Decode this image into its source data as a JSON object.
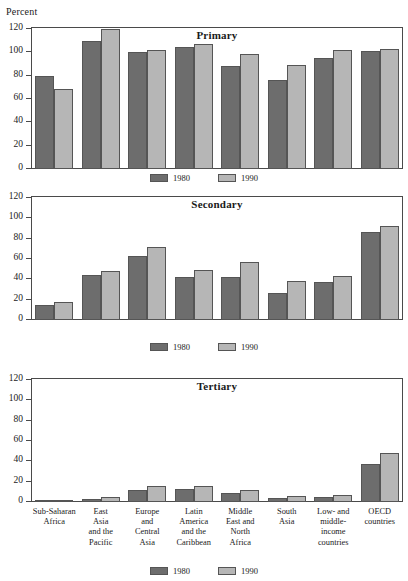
{
  "axis_label": "Percent",
  "legend": {
    "items": [
      {
        "label": "1980",
        "color": "#6d6d6d",
        "key": "s1980"
      },
      {
        "label": "1990",
        "color": "#b6b6b6",
        "key": "s1990"
      }
    ]
  },
  "y_ticks": [
    "0",
    "20",
    "40",
    "60",
    "80",
    "100",
    "120"
  ],
  "categories": [
    "Sub-Saharan Africa",
    "East Asia and the Pacific",
    "Europe and Central Asia",
    "Latin America and the Caribbean",
    "Middle East and North Africa",
    "South Asia",
    "Low- and middle-income countries",
    "OECD countries"
  ],
  "category_lines": [
    [
      "Sub-Saharan",
      "Africa"
    ],
    [
      "East",
      "Asia",
      "and the",
      "Pacific"
    ],
    [
      "Europe",
      "and",
      "Central",
      "Asia"
    ],
    [
      "Latin",
      "America",
      "and the",
      "Caribbean"
    ],
    [
      "Middle",
      "East and",
      "North",
      "Africa"
    ],
    [
      "South",
      "Asia"
    ],
    [
      "Low- and",
      "middle-",
      "income",
      "countries"
    ],
    [
      "OECD",
      "countries"
    ]
  ],
  "chart_data": [
    {
      "type": "bar",
      "title": "Primary",
      "ylabel": "Percent",
      "xlabel": "",
      "ylim": [
        0,
        120
      ],
      "ytick_step": 20,
      "grid": false,
      "legend_position": "bottom",
      "categories": [
        "Sub-Saharan Africa",
        "East Asia and the Pacific",
        "Europe and Central Asia",
        "Latin America and the Caribbean",
        "Middle East and North Africa",
        "South Asia",
        "Low- and middle-income countries",
        "OECD countries"
      ],
      "series": [
        {
          "name": "1980",
          "values": [
            80,
            110,
            100,
            105,
            88,
            76,
            95,
            101
          ]
        },
        {
          "name": "1990",
          "values": [
            69,
            120,
            102,
            107,
            99,
            89,
            102,
            103
          ]
        }
      ]
    },
    {
      "type": "bar",
      "title": "Secondary",
      "ylabel": "Percent",
      "xlabel": "",
      "ylim": [
        0,
        120
      ],
      "ytick_step": 20,
      "grid": false,
      "legend_position": "bottom",
      "categories": [
        "Sub-Saharan Africa",
        "East Asia and the Pacific",
        "Europe and Central Asia",
        "Latin America and the Caribbean",
        "Middle East and North Africa",
        "South Asia",
        "Low- and middle-income countries",
        "OECD countries"
      ],
      "series": [
        {
          "name": "1980",
          "values": [
            15,
            44,
            63,
            42,
            42,
            27,
            37,
            87
          ]
        },
        {
          "name": "1990",
          "values": [
            18,
            48,
            72,
            49,
            57,
            38,
            43,
            92
          ]
        }
      ]
    },
    {
      "type": "bar",
      "title": "Tertiary",
      "ylabel": "Percent",
      "xlabel": "",
      "ylim": [
        0,
        120
      ],
      "ytick_step": 20,
      "grid": false,
      "legend_position": "bottom",
      "categories": [
        "Sub-Saharan Africa",
        "East Asia and the Pacific",
        "Europe and Central Asia",
        "Latin America and the Caribbean",
        "Middle East and North Africa",
        "South Asia",
        "Low- and middle-income countries",
        "OECD countries"
      ],
      "series": [
        {
          "name": "1980",
          "values": [
            1.5,
            3,
            12,
            13,
            9,
            4,
            4.5,
            37
          ]
        },
        {
          "name": "1990",
          "values": [
            2,
            5,
            16,
            16,
            12,
            6,
            7,
            48
          ]
        }
      ]
    }
  ]
}
